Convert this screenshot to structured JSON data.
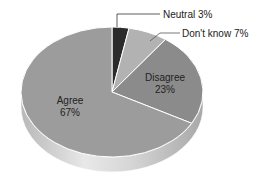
{
  "chart_data": {
    "type": "pie",
    "title": "",
    "style": "3d",
    "categories": [
      "Agree",
      "Disagree",
      "Don't know",
      "Neutral"
    ],
    "values": [
      67,
      23,
      7,
      3
    ],
    "unit": "%",
    "colors": [
      "#9c9c9c",
      "#8b8b8b",
      "#b2b2b2",
      "#2b2b2b"
    ],
    "labels": {
      "agree": {
        "name": "Agree",
        "value": "67%"
      },
      "disagree": {
        "name": "Disagree",
        "value": "23%"
      },
      "dont_know": {
        "name": "Don't know",
        "value": "7%",
        "callout": "Don't know  7%"
      },
      "neutral": {
        "name": "Neutral",
        "value": "3%",
        "callout": "Neutral  3%"
      }
    },
    "legend": "none (direct labels with leader lines for small slices)"
  }
}
